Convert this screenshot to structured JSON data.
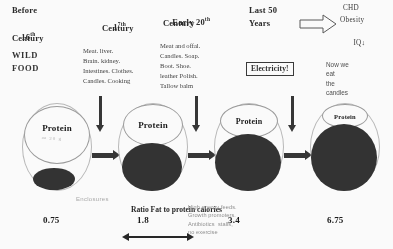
{
  "columns": [
    {
      "header_line1": "Before",
      "header_line2": "16",
      "header_sup": "th",
      "header_line3": "Century",
      "subtitle_line1": "WILD",
      "subtitle_line2": "FOOD"
    },
    {
      "header_line1": "1",
      "header_sup": "7th",
      "header_line2": "Century",
      "body": "Meat. liver.\nBrain. kidney.\nIntestines. Clothes.\nCandles. Cooking"
    },
    {
      "header_line1": "Early 20",
      "header_sup": "th",
      "header_line2": "Century",
      "body": "Meat and offal.\nCandles. Soap.\nBoot. Shoe.\nleather Polish.\nTallow balm"
    },
    {
      "header_line1": "Last 50",
      "header_line2": "Years"
    }
  ],
  "outcome": {
    "arrow": "right-arrow-outline",
    "line1": "CHD",
    "line2": "Obesity",
    "line3": "IQ",
    "line3_suffix": "↓"
  },
  "electricity": {
    "label": "Electricity!"
  },
  "now_we_eat": {
    "text": "Now we\neat\nthe\ncandles"
  },
  "eggs": [
    {
      "protein_label": "Protein",
      "inner_note": "™ 20 g",
      "value": "0.75"
    },
    {
      "protein_label": "Protein",
      "value": "1.8"
    },
    {
      "protein_label": "Protein",
      "value": "3.4"
    },
    {
      "protein_label": "Protein",
      "value": "6.75"
    }
  ],
  "annotations": {
    "enclosures": "Enclosures",
    "ratio": "Ratio Fat\nto protein\ncalories",
    "intensive": "High energy feeds.\nGrowth promoters.\nAntibiotics  stalls,\nno exercise"
  },
  "colors": {
    "fat_fill": "#2b2b2b",
    "outline": "#b9b9b9",
    "text": "#1a1a1a",
    "muted": "#8d8d8d"
  }
}
